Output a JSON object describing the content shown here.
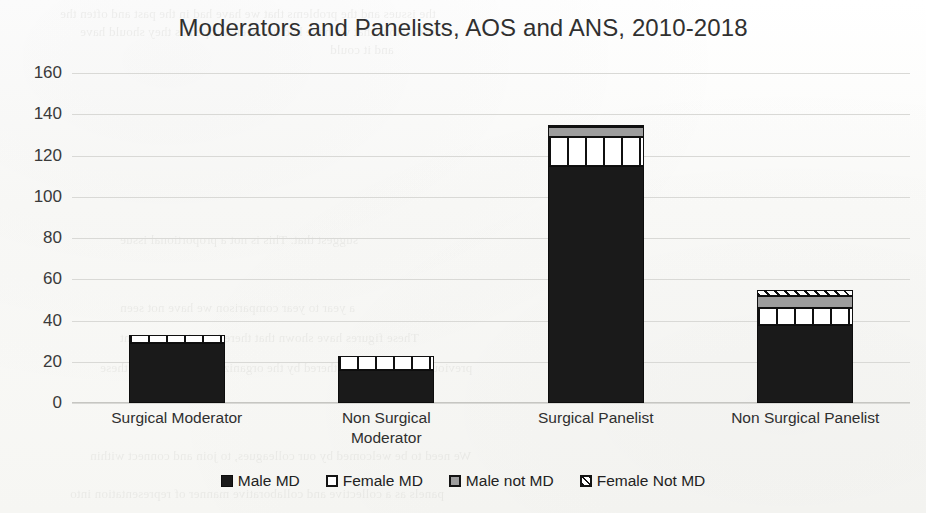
{
  "chart_data": {
    "type": "bar",
    "stacked": true,
    "title": "Moderators and Panelists, AOS and ANS, 2010-2018",
    "xlabel": "",
    "ylabel": "",
    "ylim": [
      0,
      160
    ],
    "ytick_step": 20,
    "yticks": [
      "160",
      "140",
      "120",
      "100",
      "80",
      "60",
      "40",
      "20",
      "0"
    ],
    "grid": true,
    "legend_position": "bottom",
    "categories": [
      "Surgical Moderator",
      "Non Surgical Moderator",
      "Surgical Panelist",
      "Non Surgical Panelist"
    ],
    "series": [
      {
        "name": "Male MD",
        "values": [
          29,
          16,
          115,
          38
        ]
      },
      {
        "name": "Female MD",
        "values": [
          4,
          7,
          14,
          8
        ]
      },
      {
        "name": "Male not MD",
        "values": [
          0,
          0,
          5,
          6
        ]
      },
      {
        "name": "Female Not MD",
        "values": [
          0,
          0,
          1,
          3
        ]
      }
    ],
    "totals": [
      33,
      23,
      135,
      55
    ]
  },
  "legend": {
    "items": [
      {
        "label": "Male MD",
        "pattern": "solid-black"
      },
      {
        "label": "Female MD",
        "pattern": "white-vertical-bars"
      },
      {
        "label": "Male not MD",
        "pattern": "solid-gray"
      },
      {
        "label": "Female Not MD",
        "pattern": "diagonal-hatch"
      }
    ]
  },
  "xaxis": {
    "labels": [
      "Surgical Moderator",
      "Non Surgical\nModerator",
      "Surgical Panelist",
      "Non Surgical Panelist"
    ]
  },
  "ghost_text": {
    "lines": [
      "the issues and the problems that we have had in the past and often the",
      "discussions that we have had not been as open as they should have",
      "and it could",
      "suggest that. This is not a proportional issue",
      "a year to year comparison we have not seen",
      "These figures have shown that there is no improvement",
      "previous years of data gathered by the organizers. Taken across these",
      "We need to be welcomed by our colleagues, to join and connect within",
      "panels as a collective and collaborative manner of representation into"
    ]
  }
}
